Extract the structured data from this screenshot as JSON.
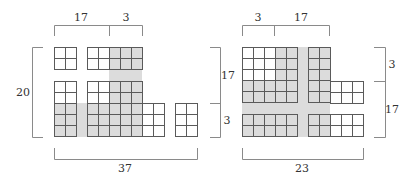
{
  "colors": {
    "shade": "#dcdcdc",
    "grid_line": "#5a5a5a",
    "bracket_line": "#8a8a8a",
    "text": "#333333"
  },
  "cell_size": 11,
  "left_figure": {
    "labels": {
      "top_left": "17",
      "top_right": "3",
      "left": "20",
      "bottom": "37"
    },
    "shaded_strips": [
      {
        "x": 109,
        "y": 70,
        "w": 33,
        "h": 11
      },
      {
        "x": 76,
        "y": 103,
        "w": 11,
        "h": 34
      }
    ],
    "blocks": [
      {
        "x": 54,
        "y": 47,
        "cols": 2,
        "rows": 2,
        "shaded": []
      },
      {
        "x": 87,
        "y": 47,
        "cols": 5,
        "rows": 2,
        "shaded_cols": [
          2,
          3,
          4
        ]
      },
      {
        "x": 54,
        "y": 81,
        "cols": 2,
        "rows": 5,
        "shaded_rows": [
          2,
          3,
          4
        ]
      },
      {
        "x": 87,
        "y": 81,
        "cols": 5,
        "rows": 5,
        "shaded_cols": [
          2,
          3,
          4
        ],
        "shaded_rows": [
          2,
          3,
          4
        ]
      },
      {
        "x": 142,
        "y": 103,
        "cols": 2,
        "rows": 3,
        "shaded": []
      },
      {
        "x": 175,
        "y": 103,
        "cols": 2,
        "rows": 3,
        "shaded": []
      }
    ]
  },
  "right_figure": {
    "labels": {
      "top_left": "3",
      "top_right": "17",
      "left_upper": "17",
      "left_lower": "3",
      "right_upper": "3",
      "right_lower": "17",
      "bottom": "23"
    },
    "shaded_strips": [
      {
        "x": 297,
        "y": 47,
        "w": 11,
        "h": 90
      },
      {
        "x": 242,
        "y": 103,
        "w": 88,
        "h": 11
      }
    ],
    "blocks": [
      {
        "x": 242,
        "y": 47,
        "cols": 5,
        "rows": 5,
        "shaded_cols": [
          3,
          4
        ],
        "shaded_rows": [
          3,
          4
        ]
      },
      {
        "x": 308,
        "y": 47,
        "cols": 2,
        "rows": 5,
        "shaded_cols": [
          0,
          1
        ]
      },
      {
        "x": 330,
        "y": 81,
        "cols": 3,
        "rows": 2,
        "shaded": []
      },
      {
        "x": 242,
        "y": 114,
        "cols": 5,
        "rows": 2,
        "shaded_cols": [
          0,
          1,
          2,
          3,
          4
        ]
      },
      {
        "x": 308,
        "y": 114,
        "cols": 5,
        "rows": 2,
        "shaded_cols": [
          0,
          1
        ]
      }
    ]
  }
}
